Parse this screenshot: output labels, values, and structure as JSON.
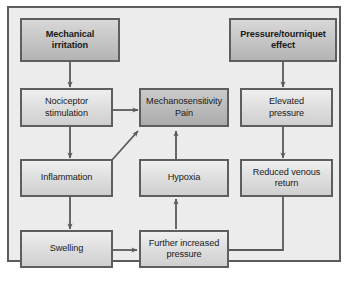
{
  "figure": {
    "type": "flowchart",
    "title": "",
    "frame_border_color": "#5c5c5c",
    "canvas_color": "#ececec",
    "node_border_color": "#5e5e5e",
    "connector_color": "#5a5a5a",
    "emphasis_fill": "#c9c9c9",
    "pain_fill": "#bdbdbd",
    "default_fill": "#e2e2e2"
  },
  "nodes": {
    "mechanical_irritation": {
      "label": "Mechanical\nirritation",
      "style": "emphasis"
    },
    "pressure_tourniquet": {
      "label": "Pressure/tourniquet\neffect",
      "style": "emphasis"
    },
    "nociceptor_stimulation": {
      "label": "Nociceptor\nstimulation",
      "style": "default"
    },
    "mechanosensitivity_pain": {
      "label": "Mechanosensitivity\nPain",
      "style": "pain"
    },
    "elevated_pressure": {
      "label": "Elevated\npressure",
      "style": "default"
    },
    "inflammation": {
      "label": "Inflammation",
      "style": "default"
    },
    "hypoxia": {
      "label": "Hypoxia",
      "style": "default"
    },
    "reduced_venous_return": {
      "label": "Reduced venous\nreturn",
      "style": "default"
    },
    "swelling": {
      "label": "Swelling",
      "style": "default"
    },
    "further_increased_pressure": {
      "label": "Further increased\npressure",
      "style": "default"
    }
  },
  "edges": [
    {
      "from": "mechanical_irritation",
      "to": "nociceptor_stimulation",
      "kind": "vertical"
    },
    {
      "from": "nociceptor_stimulation",
      "to": "inflammation",
      "kind": "vertical"
    },
    {
      "from": "nociceptor_stimulation",
      "to": "mechanosensitivity_pain",
      "kind": "horizontal"
    },
    {
      "from": "inflammation",
      "to": "mechanosensitivity_pain",
      "kind": "diagonal"
    },
    {
      "from": "inflammation",
      "to": "swelling",
      "kind": "vertical"
    },
    {
      "from": "swelling",
      "to": "further_increased_pressure",
      "kind": "horizontal"
    },
    {
      "from": "further_increased_pressure",
      "to": "hypoxia",
      "kind": "vertical-up"
    },
    {
      "from": "hypoxia",
      "to": "mechanosensitivity_pain",
      "kind": "vertical-up"
    },
    {
      "from": "pressure_tourniquet",
      "to": "elevated_pressure",
      "kind": "vertical"
    },
    {
      "from": "elevated_pressure",
      "to": "reduced_venous_return",
      "kind": "vertical"
    },
    {
      "from": "reduced_venous_return",
      "to": "further_increased_pressure",
      "kind": "elbow-down-left"
    }
  ]
}
